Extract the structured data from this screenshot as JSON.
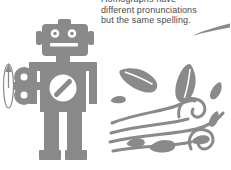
{
  "caption": {
    "line1": "Homographs have",
    "line2": "different pronunciations",
    "line3": "but the same spelling."
  },
  "icons": {
    "robot": "wind-up-robot-illustration",
    "wind": "wind-blowing-leaves-illustration",
    "leader": "curved-leader-line",
    "key": "wind-up-key",
    "rotation": "winding-rotation-arrow"
  },
  "colors": {
    "art_gray": "#8a8a8a",
    "text_gray": "#4a4a4a",
    "background": "#ffffff"
  }
}
